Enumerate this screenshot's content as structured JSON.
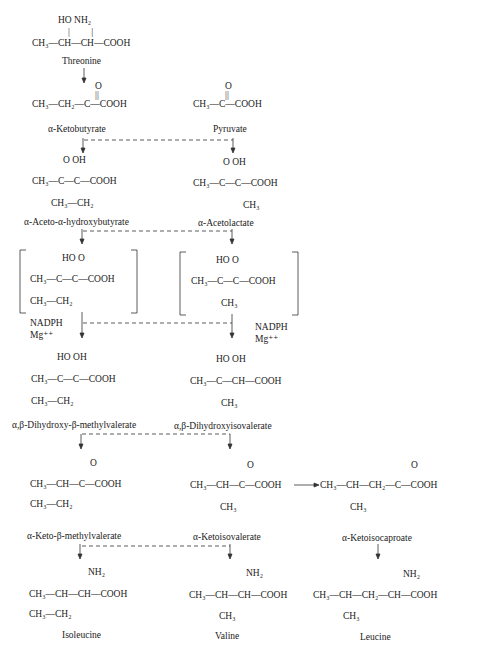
{
  "compounds": {
    "threonine": {
      "name": "Threonine",
      "top": "HO    NH₂",
      "main": "CH₃—CH—CH—COOH"
    },
    "ketobutyrate": {
      "name": "α-Ketobutyrate",
      "top": "O",
      "dbl": "||",
      "main": "CH₃—CH₂—C—COOH"
    },
    "pyruvate": {
      "name": "Pyruvate",
      "top": "O",
      "dbl": "||",
      "main": "CH₃—C—COOH"
    },
    "aceto_hydroxybutyrate": {
      "name": "α-Aceto-α-hydroxybutyrate",
      "top": "O    OH",
      "main": "CH₃—C—C—COOH",
      "bottom": "CH₃—CH₂"
    },
    "acetolactate": {
      "name": "α-Acetolactate",
      "top": "O    OH",
      "main": "CH₃—C—C—COOH",
      "bottom": "CH₃"
    },
    "intermediate_left": {
      "top": "HO    O",
      "main": "CH₃—C—C—COOH",
      "bottom": "CH₃—CH₂"
    },
    "intermediate_right": {
      "top": "HO    O",
      "main": "CH₃—C—C—COOH",
      "bottom": "CH₃"
    },
    "dihydroxy_methylvalerate": {
      "name": "α,β-Dihydroxy-β-methylvalerate",
      "top": "HO    OH",
      "main": "CH₃—C—C—COOH",
      "bottom": "CH₃—CH₂"
    },
    "dihydroxyisovalerate": {
      "name": "α,β-Dihydroxyisovalerate",
      "top": "HO    OH",
      "main": "CH₃—C—CH—COOH",
      "bottom": "CH₃"
    },
    "keto_methylvalerate": {
      "name": "α-Keto-β-methylvalerate",
      "top": "O",
      "main": "CH₃—CH—C—COOH",
      "bottom": "CH₃—CH₂"
    },
    "ketoisovalerate": {
      "name": "α-Ketoisovalerate",
      "top": "O",
      "main": "CH₃—CH—C—COOH",
      "bottom": "CH₃"
    },
    "ketoisocaproate": {
      "name": "α-Ketoisocaproate",
      "top": "O",
      "main": "CH₃—CH—CH₂—C—COOH",
      "bottom": "CH₃"
    },
    "isoleucine": {
      "name": "Isoleucine",
      "top": "NH₂",
      "main": "CH₃—CH—CH—COOH",
      "bottom": "CH₃—CH₂"
    },
    "valine": {
      "name": "Valine",
      "top": "NH₂",
      "main": "CH₃—CH—CH—COOH",
      "bottom": "CH₃"
    },
    "leucine": {
      "name": "Leucine",
      "top": "NH₂",
      "main": "CH₃—CH—CH₂—CH—COOH",
      "bottom": "CH₃"
    }
  },
  "cofactors": {
    "nadph": "NADPH",
    "mg": "Mg⁺⁺"
  }
}
